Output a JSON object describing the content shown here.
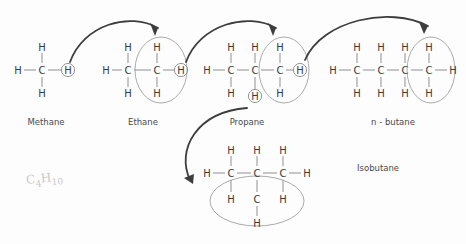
{
  "diagram": {
    "background_color": "#fdfdfd",
    "atom_color": "#3a3a3a",
    "bond_color": "#9a9a9a",
    "arrow_color": "#3d3d3d",
    "highlight_ring_color": "#8a8a8a"
  },
  "atoms": {
    "carbon": "C",
    "hydrogen": "H"
  },
  "molecules": [
    {
      "id": "methane",
      "label": "Methane",
      "label_x": 46,
      "label_y": 122,
      "carbons": [
        {
          "x": 42,
          "y": 70
        }
      ],
      "hydrogens": [
        {
          "x": 18,
          "y": 70,
          "circled": false
        },
        {
          "x": 42,
          "y": 47,
          "circled": false
        },
        {
          "x": 42,
          "y": 93,
          "circled": false
        },
        {
          "x": 68,
          "y": 70,
          "circled": true
        }
      ],
      "bonds": [
        {
          "x1": 24,
          "y1": 70,
          "x2": 36,
          "y2": 70
        },
        {
          "x1": 42,
          "y1": 53,
          "x2": 42,
          "y2": 63
        },
        {
          "x1": 42,
          "y1": 77,
          "x2": 42,
          "y2": 87
        },
        {
          "x1": 48,
          "y1": 70,
          "x2": 61,
          "y2": 70
        }
      ],
      "highlight_ellipse": null
    },
    {
      "id": "ethane",
      "label": "Ethane",
      "label_x": 143,
      "label_y": 122,
      "carbons": [
        {
          "x": 128,
          "y": 70
        },
        {
          "x": 157,
          "y": 70
        }
      ],
      "hydrogens": [
        {
          "x": 106,
          "y": 70,
          "circled": false
        },
        {
          "x": 128,
          "y": 47,
          "circled": false
        },
        {
          "x": 128,
          "y": 93,
          "circled": false
        },
        {
          "x": 157,
          "y": 47,
          "circled": false
        },
        {
          "x": 157,
          "y": 93,
          "circled": false
        },
        {
          "x": 181,
          "y": 70,
          "circled": true
        }
      ],
      "bonds": [
        {
          "x1": 112,
          "y1": 70,
          "x2": 122,
          "y2": 70
        },
        {
          "x1": 128,
          "y1": 53,
          "x2": 128,
          "y2": 63
        },
        {
          "x1": 128,
          "y1": 77,
          "x2": 128,
          "y2": 87
        },
        {
          "x1": 134,
          "y1": 70,
          "x2": 151,
          "y2": 70
        },
        {
          "x1": 157,
          "y1": 53,
          "x2": 157,
          "y2": 63
        },
        {
          "x1": 157,
          "y1": 77,
          "x2": 157,
          "y2": 87
        },
        {
          "x1": 163,
          "y1": 70,
          "x2": 174,
          "y2": 70
        }
      ],
      "highlight_ellipse": {
        "cx": 161,
        "cy": 70,
        "rx": 26,
        "ry": 33
      }
    },
    {
      "id": "propane",
      "label": "Propane",
      "label_x": 247,
      "label_y": 122,
      "carbons": [
        {
          "x": 231,
          "y": 70
        },
        {
          "x": 255,
          "y": 70
        },
        {
          "x": 280,
          "y": 70
        }
      ],
      "hydrogens": [
        {
          "x": 207,
          "y": 70,
          "circled": false
        },
        {
          "x": 231,
          "y": 47,
          "circled": false
        },
        {
          "x": 231,
          "y": 93,
          "circled": false
        },
        {
          "x": 255,
          "y": 47,
          "circled": false
        },
        {
          "x": 255,
          "y": 96,
          "circled": true
        },
        {
          "x": 280,
          "y": 47,
          "circled": false
        },
        {
          "x": 280,
          "y": 93,
          "circled": false
        },
        {
          "x": 300,
          "y": 70,
          "circled": true
        }
      ],
      "bonds": [
        {
          "x1": 213,
          "y1": 70,
          "x2": 225,
          "y2": 70
        },
        {
          "x1": 231,
          "y1": 53,
          "x2": 231,
          "y2": 63
        },
        {
          "x1": 231,
          "y1": 77,
          "x2": 231,
          "y2": 87
        },
        {
          "x1": 237,
          "y1": 70,
          "x2": 249,
          "y2": 70
        },
        {
          "x1": 255,
          "y1": 53,
          "x2": 255,
          "y2": 63
        },
        {
          "x1": 255,
          "y1": 77,
          "x2": 255,
          "y2": 89
        },
        {
          "x1": 261,
          "y1": 70,
          "x2": 274,
          "y2": 70
        },
        {
          "x1": 280,
          "y1": 53,
          "x2": 280,
          "y2": 63
        },
        {
          "x1": 280,
          "y1": 77,
          "x2": 280,
          "y2": 87
        },
        {
          "x1": 286,
          "y1": 70,
          "x2": 293,
          "y2": 70
        }
      ],
      "highlight_ellipse": {
        "cx": 284,
        "cy": 70,
        "rx": 25,
        "ry": 33
      }
    },
    {
      "id": "n-butane",
      "label": "n - butane",
      "label_x": 393,
      "label_y": 122,
      "carbons": [
        {
          "x": 357,
          "y": 70
        },
        {
          "x": 381,
          "y": 70
        },
        {
          "x": 405,
          "y": 70
        },
        {
          "x": 429,
          "y": 70
        }
      ],
      "hydrogens": [
        {
          "x": 333,
          "y": 70,
          "circled": false
        },
        {
          "x": 357,
          "y": 47,
          "circled": false
        },
        {
          "x": 357,
          "y": 93,
          "circled": false
        },
        {
          "x": 381,
          "y": 47,
          "circled": false
        },
        {
          "x": 381,
          "y": 93,
          "circled": false
        },
        {
          "x": 405,
          "y": 47,
          "circled": false
        },
        {
          "x": 405,
          "y": 93,
          "circled": false
        },
        {
          "x": 429,
          "y": 47,
          "circled": false
        },
        {
          "x": 429,
          "y": 93,
          "circled": false
        },
        {
          "x": 453,
          "y": 70,
          "circled": false
        }
      ],
      "bonds": [
        {
          "x1": 339,
          "y1": 70,
          "x2": 351,
          "y2": 70
        },
        {
          "x1": 357,
          "y1": 53,
          "x2": 357,
          "y2": 63
        },
        {
          "x1": 357,
          "y1": 77,
          "x2": 357,
          "y2": 87
        },
        {
          "x1": 363,
          "y1": 70,
          "x2": 375,
          "y2": 70
        },
        {
          "x1": 381,
          "y1": 53,
          "x2": 381,
          "y2": 63
        },
        {
          "x1": 381,
          "y1": 77,
          "x2": 381,
          "y2": 87
        },
        {
          "x1": 387,
          "y1": 70,
          "x2": 399,
          "y2": 70
        },
        {
          "x1": 405,
          "y1": 53,
          "x2": 405,
          "y2": 63
        },
        {
          "x1": 405,
          "y1": 77,
          "x2": 405,
          "y2": 87
        },
        {
          "x1": 411,
          "y1": 70,
          "x2": 423,
          "y2": 70
        },
        {
          "x1": 429,
          "y1": 53,
          "x2": 429,
          "y2": 63
        },
        {
          "x1": 429,
          "y1": 77,
          "x2": 429,
          "y2": 87
        },
        {
          "x1": 435,
          "y1": 70,
          "x2": 447,
          "y2": 70
        }
      ],
      "highlight_ellipse": {
        "cx": 431,
        "cy": 70,
        "rx": 24,
        "ry": 33
      }
    },
    {
      "id": "isobutane",
      "label": "Isobutane",
      "label_x": 357,
      "label_y": 168,
      "carbons": [
        {
          "x": 231,
          "y": 173
        },
        {
          "x": 257,
          "y": 173
        },
        {
          "x": 283,
          "y": 173
        },
        {
          "x": 257,
          "y": 199
        }
      ],
      "hydrogens": [
        {
          "x": 207,
          "y": 173,
          "circled": false
        },
        {
          "x": 231,
          "y": 150,
          "circled": false
        },
        {
          "x": 257,
          "y": 150,
          "circled": false
        },
        {
          "x": 283,
          "y": 150,
          "circled": false
        },
        {
          "x": 307,
          "y": 173,
          "circled": false
        },
        {
          "x": 231,
          "y": 199,
          "circled": false
        },
        {
          "x": 283,
          "y": 199,
          "circled": false
        },
        {
          "x": 257,
          "y": 223,
          "circled": false
        }
      ],
      "bonds": [
        {
          "x1": 213,
          "y1": 173,
          "x2": 225,
          "y2": 173
        },
        {
          "x1": 231,
          "y1": 156,
          "x2": 231,
          "y2": 166
        },
        {
          "x1": 237,
          "y1": 173,
          "x2": 251,
          "y2": 173
        },
        {
          "x1": 257,
          "y1": 156,
          "x2": 257,
          "y2": 166
        },
        {
          "x1": 263,
          "y1": 173,
          "x2": 277,
          "y2": 173
        },
        {
          "x1": 283,
          "y1": 156,
          "x2": 283,
          "y2": 166
        },
        {
          "x1": 289,
          "y1": 173,
          "x2": 301,
          "y2": 173
        },
        {
          "x1": 231,
          "y1": 180,
          "x2": 231,
          "y2": 192
        },
        {
          "x1": 257,
          "y1": 180,
          "x2": 257,
          "y2": 192
        },
        {
          "x1": 283,
          "y1": 180,
          "x2": 283,
          "y2": 192
        },
        {
          "x1": 257,
          "y1": 206,
          "x2": 257,
          "y2": 216
        }
      ],
      "highlight_ellipse": {
        "cx": 257,
        "cy": 201,
        "rx": 47,
        "ry": 25
      }
    }
  ],
  "arrows": [
    {
      "id": "methane-to-ethane",
      "from": "methane-circled-h",
      "to": "ethane-new-group",
      "path": "M 70,62 C 84,24 130,12 158,28",
      "head": "M 158,28 L 150,23 L 155,36 Z"
    },
    {
      "id": "ethane-to-propane",
      "from": "ethane-circled-h",
      "to": "propane-new-group",
      "path": "M 186,62 C 200,24 248,12 276,28",
      "head": "M 276,28 L 268,23 L 273,36 Z"
    },
    {
      "id": "propane-to-n-butane",
      "from": "propane-circled-h",
      "to": "n-butane-new-group",
      "path": "M 305,60 C 322,20 390,6 428,26",
      "head": "M 428,26 L 419,22 L 424,34 Z"
    },
    {
      "id": "propane-to-isobutane",
      "from": "propane-circled-h-branch",
      "to": "isobutane-new-group",
      "path": "M 247,108 C 196,112 176,150 190,180",
      "head": "M 193,184 L 184,178 L 194,174 Z"
    }
  ],
  "annotation": {
    "text": "C4H10",
    "x": 26,
    "y": 180,
    "style": "handwritten-faint"
  }
}
